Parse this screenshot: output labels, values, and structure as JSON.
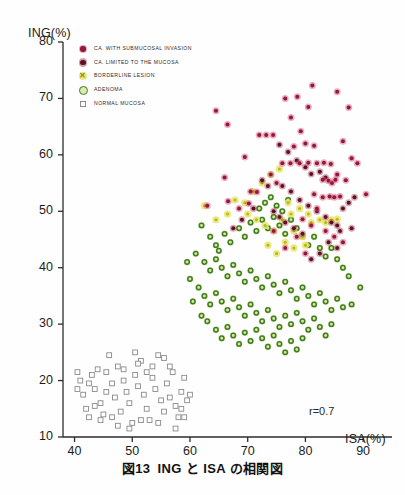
{
  "figure": {
    "caption_number": "図13",
    "caption_text": "ING と ISA の相関図"
  },
  "axes": {
    "y_title": "ING(%)",
    "x_title": "ISA(%)",
    "y_ticks": [
      "10",
      "20",
      "30",
      "40",
      "50",
      "60",
      "70",
      "80"
    ],
    "x_ticks": [
      "40",
      "50",
      "60",
      "70",
      "80",
      "90"
    ],
    "annotation": "r=0.7"
  },
  "legend": {
    "items": [
      {
        "label": "CA. WITH SUBMUCOSAL INVASION",
        "marker": "filled-circle-crimson",
        "color": "#c2275a"
      },
      {
        "label": "CA. LIMITED TO THE MUCOSA",
        "marker": "filled-circle-maroon",
        "color": "#7b1530"
      },
      {
        "label": "BORDERLINE LESION",
        "marker": "x-cross-yellow",
        "color": "#d8d62a",
        "glyph": "✕"
      },
      {
        "label": "ADENOMA",
        "marker": "ring-circle-green",
        "color": "#3f7d21"
      },
      {
        "label": "NORMAL MUCOSA",
        "marker": "open-square-gray",
        "color": "#8a8a8a"
      }
    ]
  },
  "chart_data": {
    "type": "scatter",
    "title": "ING と ISA の相関図",
    "xlabel": "ISA(%)",
    "ylabel": "ING(%)",
    "xlim": [
      38,
      95
    ],
    "ylim": [
      10,
      80
    ],
    "grid": false,
    "legend_position": "upper-left-inside",
    "annotations": [
      {
        "text": "r=0.7",
        "x": 88,
        "y": 13.5
      }
    ],
    "series": [
      {
        "name": "CA. WITH SUBMUCOSAL INVASION",
        "marker": "filled-circle-crimson",
        "color": "#c2275a",
        "points": [
          [
            64.5,
            67.8
          ],
          [
            66.5,
            65.4
          ],
          [
            72.0,
            63.5
          ],
          [
            73.2,
            63.5
          ],
          [
            74.4,
            63.5
          ],
          [
            69.5,
            59.6
          ],
          [
            66.0,
            56.0
          ],
          [
            70.5,
            53.5
          ],
          [
            71.6,
            53.4
          ],
          [
            66.6,
            51.8
          ],
          [
            63.0,
            51.0
          ],
          [
            68.5,
            50.5
          ],
          [
            70.2,
            51.4
          ],
          [
            74.0,
            56.5
          ],
          [
            75.0,
            55.0
          ],
          [
            76.0,
            58.5
          ],
          [
            77.4,
            58.5
          ],
          [
            79.0,
            58.5
          ],
          [
            80.5,
            58.6
          ],
          [
            82.0,
            58.5
          ],
          [
            83.2,
            58.6
          ],
          [
            84.4,
            58.4
          ],
          [
            78.0,
            61.5
          ],
          [
            80.0,
            62.0
          ],
          [
            81.5,
            61.6
          ],
          [
            79.2,
            64.2
          ],
          [
            77.5,
            66.6
          ],
          [
            80.5,
            68.5
          ],
          [
            78.6,
            70.3
          ],
          [
            76.5,
            70.0
          ],
          [
            81.2,
            72.3
          ],
          [
            85.5,
            71.2
          ],
          [
            87.5,
            68.4
          ],
          [
            86.5,
            62.4
          ],
          [
            88.0,
            59.4
          ],
          [
            89.0,
            58.5
          ],
          [
            85.5,
            56.5
          ],
          [
            87.0,
            55.5
          ],
          [
            83.0,
            55.6
          ],
          [
            84.0,
            55.4
          ],
          [
            84.6,
            55.0
          ],
          [
            85.2,
            55.6
          ],
          [
            81.5,
            53.0
          ],
          [
            83.0,
            52.5
          ],
          [
            84.2,
            52.6
          ],
          [
            85.0,
            52.5
          ],
          [
            86.0,
            52.6
          ],
          [
            90.5,
            53.0
          ],
          [
            82.0,
            50.5
          ],
          [
            79.5,
            48.6
          ],
          [
            81.0,
            47.5
          ],
          [
            83.5,
            46.5
          ],
          [
            85.0,
            45.5
          ],
          [
            86.5,
            44.5
          ],
          [
            78.5,
            45.5
          ],
          [
            76.5,
            43.5
          ],
          [
            80.0,
            42.5
          ],
          [
            74.5,
            46.5
          ]
        ]
      },
      {
        "name": "CA. LIMITED TO THE MUCOSA",
        "marker": "filled-circle-maroon",
        "color": "#7b1530",
        "points": [
          [
            75.5,
            61.8
          ],
          [
            77.0,
            60.5
          ],
          [
            78.5,
            59.0
          ],
          [
            80.0,
            57.8
          ],
          [
            81.0,
            56.6
          ],
          [
            82.5,
            57.0
          ],
          [
            83.5,
            56.0
          ],
          [
            76.0,
            54.5
          ],
          [
            77.5,
            53.5
          ],
          [
            79.0,
            52.0
          ],
          [
            80.5,
            51.0
          ],
          [
            82.0,
            50.0
          ],
          [
            83.5,
            49.0
          ],
          [
            84.5,
            48.0
          ],
          [
            85.5,
            47.5
          ],
          [
            86.5,
            50.5
          ],
          [
            87.5,
            51.5
          ],
          [
            88.5,
            52.5
          ],
          [
            84.0,
            44.5
          ],
          [
            85.5,
            43.5
          ],
          [
            82.5,
            42.5
          ],
          [
            81.0,
            41.5
          ],
          [
            86.0,
            46.5
          ],
          [
            88.0,
            47.0
          ],
          [
            72.5,
            55.5
          ],
          [
            73.5,
            54.5
          ],
          [
            71.0,
            50.5
          ],
          [
            69.0,
            48.5
          ],
          [
            67.5,
            47.0
          ],
          [
            74.5,
            50.0
          ],
          [
            75.5,
            49.0
          ],
          [
            76.5,
            48.0
          ],
          [
            78.0,
            47.0
          ],
          [
            79.5,
            46.0
          ]
        ]
      },
      {
        "name": "BORDERLINE LESION",
        "marker": "x-cross-yellow",
        "color": "#d8d62a",
        "points": [
          [
            62.5,
            51.0
          ],
          [
            64.5,
            48.5
          ],
          [
            66.5,
            49.5
          ],
          [
            67.8,
            52.0
          ],
          [
            69.5,
            51.5
          ],
          [
            71.0,
            53.5
          ],
          [
            72.5,
            55.0
          ],
          [
            74.0,
            56.5
          ],
          [
            75.5,
            57.5
          ],
          [
            70.0,
            49.5
          ],
          [
            71.5,
            48.5
          ],
          [
            73.0,
            47.5
          ],
          [
            74.5,
            46.5
          ],
          [
            76.0,
            48.5
          ],
          [
            77.5,
            49.5
          ],
          [
            79.0,
            50.5
          ],
          [
            80.5,
            49.5
          ],
          [
            78.0,
            46.5
          ],
          [
            79.5,
            45.5
          ],
          [
            81.0,
            48.0
          ],
          [
            82.5,
            48.5
          ],
          [
            83.5,
            48.0
          ],
          [
            76.5,
            44.5
          ],
          [
            78.0,
            43.5
          ],
          [
            75.0,
            42.5
          ],
          [
            73.5,
            44.0
          ],
          [
            80.0,
            44.0
          ],
          [
            84.5,
            48.5
          ],
          [
            85.5,
            48.6
          ],
          [
            77.0,
            51.5
          ]
        ]
      },
      {
        "name": "ADENOMA",
        "marker": "ring-circle-green",
        "color": "#3f7d21",
        "points": [
          [
            62.0,
            47.5
          ],
          [
            63.5,
            45.5
          ],
          [
            64.5,
            44.0
          ],
          [
            66.0,
            46.0
          ],
          [
            67.0,
            44.5
          ],
          [
            68.5,
            47.0
          ],
          [
            69.5,
            45.5
          ],
          [
            70.5,
            48.0
          ],
          [
            71.5,
            46.5
          ],
          [
            72.5,
            48.5
          ],
          [
            73.5,
            47.0
          ],
          [
            74.5,
            49.0
          ],
          [
            75.5,
            47.5
          ],
          [
            76.5,
            46.0
          ],
          [
            77.5,
            48.5
          ],
          [
            78.5,
            47.0
          ],
          [
            79.5,
            45.5
          ],
          [
            80.5,
            44.0
          ],
          [
            81.5,
            45.5
          ],
          [
            82.5,
            43.5
          ],
          [
            83.5,
            42.0
          ],
          [
            84.5,
            43.5
          ],
          [
            85.5,
            41.5
          ],
          [
            86.5,
            40.0
          ],
          [
            72.0,
            50.5
          ],
          [
            73.0,
            51.5
          ],
          [
            74.0,
            52.5
          ],
          [
            75.0,
            51.0
          ],
          [
            76.0,
            50.0
          ],
          [
            77.0,
            52.0
          ],
          [
            61.0,
            42.5
          ],
          [
            62.5,
            41.0
          ],
          [
            63.5,
            39.5
          ],
          [
            64.5,
            41.5
          ],
          [
            65.5,
            40.0
          ],
          [
            66.5,
            38.5
          ],
          [
            67.5,
            40.5
          ],
          [
            68.5,
            39.0
          ],
          [
            69.5,
            37.5
          ],
          [
            70.5,
            39.5
          ],
          [
            71.5,
            38.0
          ],
          [
            72.5,
            36.5
          ],
          [
            73.5,
            38.5
          ],
          [
            74.5,
            37.0
          ],
          [
            75.5,
            35.5
          ],
          [
            76.5,
            37.5
          ],
          [
            77.5,
            36.0
          ],
          [
            78.5,
            34.5
          ],
          [
            79.5,
            36.5
          ],
          [
            80.5,
            35.0
          ],
          [
            81.5,
            33.5
          ],
          [
            82.5,
            35.5
          ],
          [
            83.5,
            34.0
          ],
          [
            84.5,
            32.5
          ],
          [
            85.5,
            34.5
          ],
          [
            60.0,
            38.0
          ],
          [
            61.5,
            36.5
          ],
          [
            62.5,
            35.0
          ],
          [
            63.5,
            33.5
          ],
          [
            64.5,
            35.5
          ],
          [
            65.5,
            34.0
          ],
          [
            66.5,
            32.5
          ],
          [
            67.5,
            34.5
          ],
          [
            68.5,
            33.0
          ],
          [
            69.5,
            31.5
          ],
          [
            70.5,
            33.5
          ],
          [
            71.5,
            32.0
          ],
          [
            72.5,
            30.5
          ],
          [
            73.5,
            32.5
          ],
          [
            74.5,
            31.0
          ],
          [
            75.5,
            29.5
          ],
          [
            76.5,
            31.5
          ],
          [
            77.5,
            30.0
          ],
          [
            78.5,
            32.0
          ],
          [
            79.5,
            30.5
          ],
          [
            80.5,
            29.0
          ],
          [
            81.5,
            31.0
          ],
          [
            82.5,
            29.5
          ],
          [
            83.5,
            28.0
          ],
          [
            84.5,
            30.0
          ],
          [
            63.0,
            30.5
          ],
          [
            64.5,
            29.0
          ],
          [
            65.5,
            27.5
          ],
          [
            66.5,
            29.5
          ],
          [
            67.5,
            28.0
          ],
          [
            68.5,
            26.5
          ],
          [
            69.5,
            28.5
          ],
          [
            70.5,
            27.0
          ],
          [
            71.5,
            29.0
          ],
          [
            72.5,
            27.5
          ],
          [
            73.5,
            26.0
          ],
          [
            74.5,
            28.0
          ],
          [
            75.5,
            26.5
          ],
          [
            76.5,
            25.0
          ],
          [
            77.5,
            27.0
          ],
          [
            78.5,
            25.5
          ],
          [
            79.5,
            27.5
          ],
          [
            86.5,
            33.0
          ],
          [
            88.0,
            33.5
          ],
          [
            89.5,
            36.5
          ],
          [
            65.0,
            43.0
          ],
          [
            60.5,
            34.0
          ],
          [
            62.0,
            31.5
          ],
          [
            59.5,
            41.0
          ],
          [
            87.5,
            38.5
          ]
        ]
      },
      {
        "name": "NORMAL MUCOSA",
        "marker": "open-square-gray",
        "color": "#8a8a8a",
        "points": [
          [
            41.0,
            20.0
          ],
          [
            41.5,
            17.5
          ],
          [
            42.0,
            15.0
          ],
          [
            42.5,
            13.5
          ],
          [
            43.5,
            18.5
          ],
          [
            44.5,
            16.0
          ],
          [
            45.0,
            14.0
          ],
          [
            45.5,
            21.5
          ],
          [
            46.5,
            19.5
          ],
          [
            47.0,
            17.0
          ],
          [
            47.5,
            22.5
          ],
          [
            48.0,
            14.5
          ],
          [
            48.5,
            20.0
          ],
          [
            49.0,
            18.0
          ],
          [
            49.5,
            16.0
          ],
          [
            50.0,
            12.5
          ],
          [
            50.5,
            21.0
          ],
          [
            51.0,
            19.0
          ],
          [
            51.5,
            23.5
          ],
          [
            52.0,
            17.5
          ],
          [
            52.5,
            15.0
          ],
          [
            53.0,
            13.0
          ],
          [
            53.5,
            20.5
          ],
          [
            54.0,
            18.5
          ],
          [
            54.5,
            12.5
          ],
          [
            55.0,
            16.5
          ],
          [
            55.5,
            14.5
          ],
          [
            56.0,
            19.5
          ],
          [
            56.5,
            17.0
          ],
          [
            57.0,
            21.5
          ],
          [
            57.5,
            15.5
          ],
          [
            58.0,
            13.5
          ],
          [
            58.5,
            18.0
          ],
          [
            59.0,
            20.5
          ],
          [
            59.5,
            16.5
          ],
          [
            44.0,
            22.0
          ],
          [
            46.0,
            24.5
          ],
          [
            50.5,
            25.0
          ],
          [
            51.0,
            23.0
          ],
          [
            53.5,
            22.5
          ],
          [
            55.5,
            24.0
          ],
          [
            43.0,
            21.0
          ],
          [
            47.5,
            12.0
          ],
          [
            49.5,
            11.5
          ],
          [
            57.5,
            11.5
          ],
          [
            40.5,
            18.5
          ],
          [
            42.5,
            19.5
          ],
          [
            45.5,
            18.0
          ],
          [
            48.5,
            22.0
          ],
          [
            52.5,
            21.5
          ],
          [
            56.5,
            22.5
          ],
          [
            58.5,
            15.0
          ],
          [
            44.5,
            13.0
          ],
          [
            46.5,
            13.5
          ],
          [
            54.5,
            24.5
          ],
          [
            40.5,
            21.5
          ],
          [
            43.5,
            15.5
          ],
          [
            51.5,
            13.0
          ],
          [
            59.0,
            13.5
          ],
          [
            60.0,
            17.5
          ]
        ]
      }
    ]
  }
}
